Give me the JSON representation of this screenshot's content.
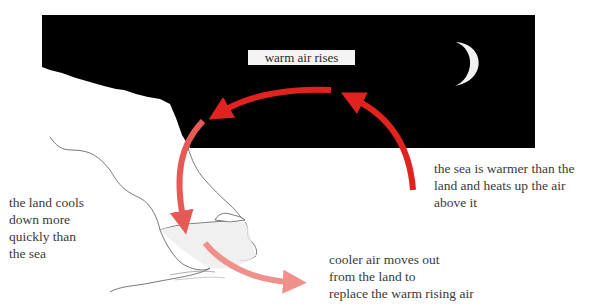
{
  "diagram": {
    "title_label": "warm air rises",
    "captions": {
      "land": "the land cools\ndown more\nquickly than\nthe sea",
      "sea": "the sea is warmer than the\nland and heats up the air\nabove it",
      "cooler_air": "cooler air moves out\nfrom the land to\nreplace the warm rising air"
    },
    "colors": {
      "night_sky": "#000000",
      "moon": "#f2f2f2",
      "warm_arrow": "#e0231e",
      "mid_arrow": "#e65a55",
      "cool_arrow": "#f0908a",
      "coastline": "#555555",
      "beach_fill": "#ececec"
    },
    "scene": "land breeze at night",
    "icons": [
      "crescent-moon-icon",
      "warm-air-arrow",
      "cooling-air-arrow",
      "outflow-arrow"
    ]
  }
}
